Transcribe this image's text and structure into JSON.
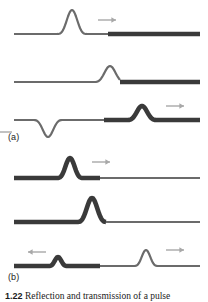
{
  "figure": {
    "labels": {
      "part_a": "(a)",
      "part_b": "(b)"
    },
    "caption": {
      "number": "1.22",
      "text": "Reflection and transmission of a pulse"
    },
    "colors": {
      "rope_light": "#6b6b6b",
      "rope_heavy": "#3a3a3a",
      "arrow": "#a8a8a8",
      "label_text": "#1c1c1c",
      "background": "#ffffff"
    },
    "stroke_widths": {
      "light_rope_px": 2.2,
      "heavy_rope_px": 4.6,
      "arrow_px": 1.4
    }
  },
  "panels": [
    {
      "id": "panel-a1",
      "part": "(a)",
      "sequence": 1,
      "description": "Incident upright pulse travelling right on the light rope, approaching the junction with the heavy rope",
      "baseline_y": 34,
      "junction_x": 108,
      "rope_left": {
        "type": "light",
        "from_x": 14,
        "to_x": 108
      },
      "rope_right": {
        "type": "heavy",
        "from_x": 108,
        "to_x": 200
      },
      "pulses": [
        {
          "name": "incident",
          "center_x": 72,
          "amplitude": 24,
          "half_width": 16,
          "orientation": "up",
          "on": "light"
        }
      ],
      "arrows": [
        {
          "name": "incident-direction",
          "direction": "right",
          "x": 98,
          "y": 20,
          "length": 18
        }
      ]
    },
    {
      "id": "panel-a2",
      "part": "(a)",
      "sequence": 2,
      "description": "Pulse arriving at the junction",
      "baseline_y": 34,
      "junction_x": 120,
      "rope_left": {
        "type": "light",
        "from_x": 14,
        "to_x": 120
      },
      "rope_right": {
        "type": "heavy",
        "from_x": 120,
        "to_x": 200
      },
      "pulses": [
        {
          "name": "at-junction",
          "center_x": 110,
          "amplitude": 16,
          "half_width": 17,
          "orientation": "up",
          "on": "light"
        }
      ],
      "arrows": []
    },
    {
      "id": "panel-a3",
      "part": "(a)",
      "sequence": 3,
      "description": "Inverted reflected pulse travels left on the light rope; smaller upright transmitted pulse travels right on the heavy rope",
      "baseline_y": 26,
      "junction_x": 104,
      "rope_left": {
        "type": "light",
        "from_x": 14,
        "to_x": 104
      },
      "rope_right": {
        "type": "heavy",
        "from_x": 104,
        "to_x": 200
      },
      "pulses": [
        {
          "name": "reflected-inverted",
          "center_x": 48,
          "amplitude": 17,
          "half_width": 16,
          "orientation": "down",
          "on": "light"
        },
        {
          "name": "transmitted",
          "center_x": 142,
          "amplitude": 14,
          "half_width": 16,
          "orientation": "up",
          "on": "heavy"
        }
      ],
      "arrows": [
        {
          "name": "reflected-direction",
          "direction": "left",
          "x": 12,
          "y": 38,
          "length": 18
        },
        {
          "name": "transmitted-direction",
          "direction": "right",
          "x": 166,
          "y": 12,
          "length": 18
        }
      ]
    },
    {
      "id": "panel-b1",
      "part": "(b)",
      "sequence": 1,
      "description": "Incident upright pulse travelling right on the heavy rope, approaching the junction with the light rope",
      "baseline_y": 32,
      "junction_x": 100,
      "rope_left": {
        "type": "heavy",
        "from_x": 14,
        "to_x": 100
      },
      "rope_right": {
        "type": "light",
        "from_x": 100,
        "to_x": 200
      },
      "pulses": [
        {
          "name": "incident",
          "center_x": 70,
          "amplitude": 20,
          "half_width": 14,
          "orientation": "up",
          "on": "heavy"
        }
      ],
      "arrows": [
        {
          "name": "incident-direction",
          "direction": "right",
          "x": 92,
          "y": 16,
          "length": 18
        }
      ]
    },
    {
      "id": "panel-b2",
      "part": "(b)",
      "sequence": 2,
      "description": "Pulse arriving at the junction",
      "baseline_y": 32,
      "junction_x": 106,
      "rope_left": {
        "type": "heavy",
        "from_x": 14,
        "to_x": 106
      },
      "rope_right": {
        "type": "light",
        "from_x": 106,
        "to_x": 200
      },
      "pulses": [
        {
          "name": "at-junction",
          "center_x": 92,
          "amplitude": 24,
          "half_width": 16,
          "orientation": "up",
          "on": "heavy"
        }
      ],
      "arrows": []
    },
    {
      "id": "panel-b3",
      "part": "(b)",
      "sequence": 3,
      "description": "Small upright reflected pulse travels left on the heavy rope; larger upright transmitted pulse travels right on the light rope",
      "baseline_y": 30,
      "junction_x": 100,
      "rope_left": {
        "type": "heavy",
        "from_x": 14,
        "to_x": 100
      },
      "rope_right": {
        "type": "light",
        "from_x": 100,
        "to_x": 200
      },
      "pulses": [
        {
          "name": "reflected-upright",
          "center_x": 58,
          "amplitude": 9,
          "half_width": 10,
          "orientation": "up",
          "on": "heavy"
        },
        {
          "name": "transmitted",
          "center_x": 146,
          "amplitude": 16,
          "half_width": 13,
          "orientation": "up",
          "on": "light"
        }
      ],
      "arrows": [
        {
          "name": "reflected-direction",
          "direction": "left",
          "x": 46,
          "y": 16,
          "length": 18
        },
        {
          "name": "transmitted-direction",
          "direction": "right",
          "x": 166,
          "y": 14,
          "length": 18
        }
      ]
    }
  ]
}
